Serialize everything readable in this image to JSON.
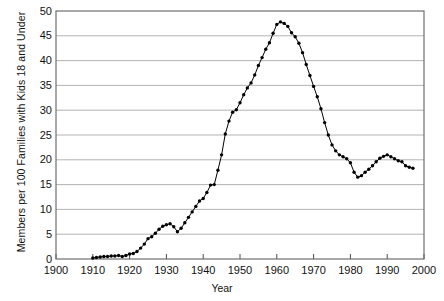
{
  "chart_data": {
    "type": "line",
    "title": "",
    "subtitle": "",
    "xlabel": "Year",
    "ylabel": "Members per 100 Families with Kids 18 and Under",
    "xlim": [
      1900,
      2000
    ],
    "ylim": [
      0,
      50
    ],
    "xticks": [
      1900,
      1910,
      1920,
      1930,
      1940,
      1950,
      1960,
      1970,
      1980,
      1990,
      2000
    ],
    "xticklabels": [
      "1900",
      "1910",
      "1920",
      "1930",
      "1940",
      "1950",
      "1960",
      "1970",
      "1980",
      "1990",
      "2000"
    ],
    "yticks": [
      0,
      5,
      10,
      15,
      20,
      25,
      30,
      35,
      40,
      45,
      50
    ],
    "yticklabels": [
      "0",
      "5",
      "10",
      "15",
      "20",
      "25",
      "30",
      "35",
      "40",
      "45",
      "50"
    ],
    "grid": "horizontal",
    "grid_color": "#aaaaaa",
    "legend": "none",
    "marker": "filled-circle",
    "marker_color": "#000000",
    "line_color": "#000000",
    "series": [
      {
        "name": "Members per 100 Families with Kids 18 and Under",
        "x": [
          1910,
          1911,
          1912,
          1913,
          1914,
          1915,
          1916,
          1917,
          1918,
          1919,
          1920,
          1921,
          1922,
          1923,
          1924,
          1925,
          1926,
          1927,
          1928,
          1929,
          1930,
          1931,
          1932,
          1933,
          1934,
          1935,
          1936,
          1937,
          1938,
          1939,
          1940,
          1941,
          1942,
          1943,
          1944,
          1945,
          1946,
          1947,
          1948,
          1949,
          1950,
          1951,
          1952,
          1953,
          1954,
          1955,
          1956,
          1957,
          1958,
          1959,
          1960,
          1961,
          1962,
          1963,
          1964,
          1965,
          1966,
          1967,
          1968,
          1969,
          1970,
          1971,
          1972,
          1973,
          1974,
          1975,
          1976,
          1977,
          1978,
          1979,
          1980,
          1981,
          1982,
          1983,
          1984,
          1985,
          1986,
          1987,
          1988,
          1989,
          1990,
          1991,
          1992,
          1993,
          1994,
          1995,
          1996,
          1997
        ],
        "values": [
          0.2,
          0.3,
          0.4,
          0.5,
          0.5,
          0.6,
          0.6,
          0.7,
          0.5,
          0.7,
          1.0,
          1.1,
          1.5,
          2.2,
          3.0,
          4.1,
          4.5,
          5.2,
          6.0,
          6.6,
          6.9,
          7.1,
          6.5,
          5.5,
          6.2,
          7.3,
          8.4,
          9.5,
          10.6,
          11.7,
          12.2,
          13.4,
          14.9,
          15.0,
          17.9,
          21.0,
          25.2,
          27.8,
          29.6,
          30.1,
          31.5,
          33.1,
          34.5,
          35.5,
          37.1,
          39.0,
          40.6,
          42.3,
          43.6,
          45.5,
          47.3,
          47.8,
          47.5,
          46.9,
          45.6,
          44.8,
          43.5,
          41.6,
          39.2,
          37.0,
          34.8,
          32.7,
          30.3,
          27.5,
          25.0,
          23.0,
          21.8,
          21.0,
          20.6,
          20.2,
          19.4,
          17.5,
          16.5,
          16.8,
          17.5,
          18.1,
          18.8,
          19.6,
          20.3,
          20.7,
          21.0,
          20.6,
          20.2,
          19.8,
          19.6,
          18.8,
          18.5,
          18.3
        ]
      }
    ]
  },
  "axes": {
    "plot_left_px": 56,
    "plot_right_px": 424,
    "plot_top_px": 11,
    "plot_bottom_px": 259
  }
}
